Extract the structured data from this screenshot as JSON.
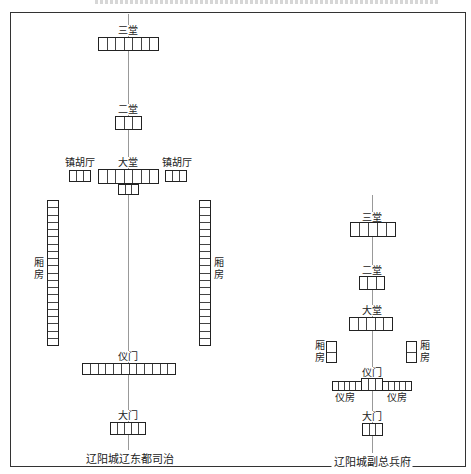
{
  "figure": {
    "top_caption_truncated": true
  },
  "left_plan": {
    "caption": "辽阳城辽东都司治",
    "buildings": {
      "santang": {
        "label": "三堂",
        "cells": 7
      },
      "ertang": {
        "label": "二堂",
        "cells": 3
      },
      "datang": {
        "label": "大堂",
        "cells": 7,
        "sub_cells": 3
      },
      "zhenhuting_left": {
        "label": "镇胡厅",
        "cells": 3
      },
      "zhenhuting_right": {
        "label": "镇胡厅",
        "cells": 3
      },
      "xiangfang_left": {
        "label": "厢房",
        "cells": 20
      },
      "xiangfang_right": {
        "label": "厢房",
        "cells": 20
      },
      "yimen": {
        "label": "仪门",
        "cells": 12
      },
      "damen": {
        "label": "大门",
        "cells": 5
      }
    }
  },
  "right_plan": {
    "caption": "辽阳城副总兵府",
    "buildings": {
      "santang": {
        "label": "三堂",
        "cells": 5
      },
      "ertang": {
        "label": "二堂",
        "cells": 3
      },
      "datang": {
        "label": "大堂",
        "cells": 5
      },
      "xiangfang_left": {
        "label": "厢房",
        "cells": 2
      },
      "xiangfang_right": {
        "label": "厢房",
        "cells": 2
      },
      "yimen": {
        "label": "仪门",
        "cells": 3
      },
      "yifang_left": {
        "label": "仪房",
        "cells": 5
      },
      "yifang_right": {
        "label": "仪房",
        "cells": 5
      },
      "damen": {
        "label": "大门",
        "cells": 3
      }
    }
  },
  "colors": {
    "line": "#222222",
    "axis": "#999999",
    "background": "#ffffff"
  }
}
